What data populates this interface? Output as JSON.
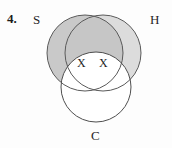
{
  "figure": {
    "item_number": "4.",
    "clipped_header_text": "",
    "type": "venn-diagram-three-circle",
    "labels": {
      "set_s": "S",
      "set_h": "H",
      "set_c": "C"
    },
    "marks": [
      {
        "symbol": "X",
        "name": "x-mark-left",
        "region": "S-and-C-only"
      },
      {
        "symbol": "X",
        "name": "x-mark-right",
        "region": "H-and-C-only"
      }
    ],
    "circles": [
      {
        "id": "S",
        "cx": 85,
        "cy": 53,
        "r": 38,
        "fill": "#c9c9c9",
        "shaded": true
      },
      {
        "id": "H",
        "cx": 103,
        "cy": 53,
        "r": 38,
        "fill": "#dcdcdc",
        "shaded": true
      },
      {
        "id": "C",
        "cx": 96,
        "cy": 87,
        "r": 35,
        "fill": "#ffffff",
        "shaded": false
      }
    ],
    "colors": {
      "background": "#fdfdfd",
      "stroke": "#555555",
      "shade_s": "#c9c9c9",
      "shade_h": "#dcdcdc",
      "shade_overlap": "#c4c4c4",
      "text": "#1f1f1f"
    }
  }
}
